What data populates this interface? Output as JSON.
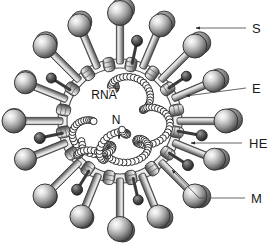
{
  "figure": {
    "background_color": "#ffffff",
    "line_color": "#555555",
    "text_color": "#1a1a1a"
  },
  "callouts": [
    {
      "key": "S",
      "label": "S",
      "label_x": 252,
      "label_y": 33,
      "line_x1": 246,
      "line_y1": 28,
      "line_x2": 196,
      "line_y2": 28,
      "arrow_x": 192,
      "arrow_y": 28,
      "arrow_angle": 180
    },
    {
      "key": "E",
      "label": "E",
      "label_x": 252,
      "label_y": 93,
      "line_x1": 246,
      "line_y1": 88,
      "line_x2": 186,
      "line_y2": 96,
      "arrow_x": 182,
      "arrow_y": 97,
      "arrow_angle": 188
    },
    {
      "key": "HE",
      "label": "HE",
      "label_x": 249,
      "label_y": 148,
      "line_x1": 242,
      "line_y1": 143,
      "line_x2": 191,
      "line_y2": 143,
      "arrow_x": 187,
      "arrow_y": 143,
      "arrow_angle": 180
    },
    {
      "key": "M",
      "label": "M",
      "label_x": 251,
      "label_y": 203,
      "line_x1": 245,
      "line_y1": 198,
      "line_x2": 199,
      "line_y2": 198,
      "line_x3": 172,
      "line_y3": 170,
      "arrow_x": 170,
      "arrow_y": 168,
      "arrow_angle": 226
    }
  ],
  "inner_labels": [
    {
      "key": "RNA",
      "label": "RNA",
      "x": 104,
      "y": 99
    },
    {
      "key": "N",
      "label": "N",
      "x": 116,
      "y": 124
    }
  ],
  "n_arrow": {
    "line_x1": 119,
    "line_y1": 128,
    "line_x2": 119,
    "line_y2": 139,
    "arrow_x": 119,
    "arrow_y": 142
  },
  "colors": {
    "envelope_fill": "#f2f2f2",
    "envelope_stroke": "#4a4a4a",
    "spike_head_light": "#f5f5f5",
    "spike_head_mid": "#9a9a9a",
    "spike_head_dark": "#3c3c3c",
    "spike_stalk_light": "#e2e2e2",
    "spike_stalk_dark": "#5a5a5a",
    "m_protein_light": "#e8e8e8",
    "m_protein_dark": "#4f4f4f",
    "he_knob": "#2e2e2e",
    "rna_bead_fill": "#ffffff",
    "rna_bead_stroke": "#1c1c1c"
  },
  "structure": {
    "virion_center_x": 120,
    "virion_center_y": 121,
    "envelope_outer_radius": 62,
    "envelope_inner_radius": 53,
    "spike_count": 16,
    "he_count": 8,
    "m_protein_count": 16
  },
  "spikes": [
    {
      "angle": -90,
      "length": 46,
      "head_r": 12.5
    },
    {
      "angle": -67,
      "length": 42,
      "head_r": 11.5
    },
    {
      "angle": -45,
      "length": 44,
      "head_r": 12.0
    },
    {
      "angle": -23,
      "length": 40,
      "head_r": 11.0
    },
    {
      "angle": 0,
      "length": 44,
      "head_r": 12.0
    },
    {
      "angle": 22,
      "length": 40,
      "head_r": 11.0
    },
    {
      "angle": 45,
      "length": 44,
      "head_r": 12.0
    },
    {
      "angle": 68,
      "length": 41,
      "head_r": 11.5
    },
    {
      "angle": 90,
      "length": 46,
      "head_r": 12.5
    },
    {
      "angle": 112,
      "length": 41,
      "head_r": 11.5
    },
    {
      "angle": 135,
      "length": 44,
      "head_r": 12.0
    },
    {
      "angle": 158,
      "length": 40,
      "head_r": 11.0
    },
    {
      "angle": 180,
      "length": 44,
      "head_r": 12.0
    },
    {
      "angle": 202,
      "length": 40,
      "head_r": 11.0
    },
    {
      "angle": 225,
      "length": 44,
      "head_r": 12.0
    },
    {
      "angle": 247,
      "length": 42,
      "head_r": 11.5
    }
  ],
  "he_knobs": [
    {
      "angle": -78,
      "length": 20,
      "head_r": 5.5
    },
    {
      "angle": -34,
      "length": 18,
      "head_r": 5.0
    },
    {
      "angle": 10,
      "length": 21,
      "head_r": 5.5
    },
    {
      "angle": 33,
      "length": 19,
      "head_r": 5.5
    },
    {
      "angle": 77,
      "length": 19,
      "head_r": 5.0
    },
    {
      "angle": 122,
      "length": 19,
      "head_r": 5.5
    },
    {
      "angle": 168,
      "length": 20,
      "head_r": 5.5
    },
    {
      "angle": 212,
      "length": 19,
      "head_r": 5.0
    }
  ],
  "m_proteins": [
    {
      "angle": -101
    },
    {
      "angle": -79
    },
    {
      "angle": -56
    },
    {
      "angle": -34
    },
    {
      "angle": -11
    },
    {
      "angle": 11
    },
    {
      "angle": 34
    },
    {
      "angle": 56
    },
    {
      "angle": 79
    },
    {
      "angle": 101
    },
    {
      "angle": 124
    },
    {
      "angle": 146
    },
    {
      "angle": 169
    },
    {
      "angle": 191
    },
    {
      "angle": 214
    },
    {
      "angle": 236
    }
  ],
  "rna_helix": {
    "description": "helical nucleocapsid strand of N protein beads coiled around viral RNA",
    "bead_radius": 3.4,
    "turns": 5,
    "bead_count": 132
  }
}
